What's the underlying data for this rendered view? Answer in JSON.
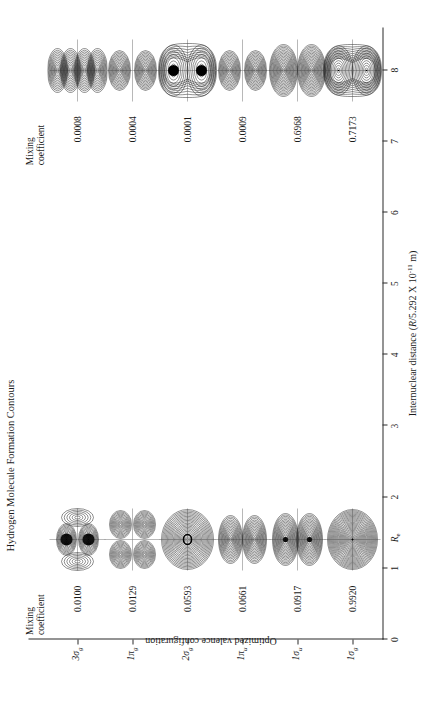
{
  "figure": {
    "title": "Hydrogen Molecule Formation Contours",
    "width": 433,
    "height": 701,
    "rotation_deg": -90,
    "background": "#ffffff",
    "ink": "#1a1a1a"
  },
  "axes": {
    "x": {
      "label_plain": "Internuclear distance (R/5.292 X 10-11 m)",
      "label_prefix": "Internuclear distance (",
      "label_var": "R",
      "label_mid": "/5.292 X 10",
      "label_exp": "-11",
      "label_suffix": " m)",
      "ticks": [
        "0",
        "1",
        "2",
        "3",
        "4",
        "5",
        "6",
        "7",
        "8"
      ],
      "values": [
        0,
        1,
        2,
        3,
        4,
        5,
        6,
        7,
        8
      ],
      "min": 0,
      "max": 8.6,
      "re_marker_label": "Re",
      "re_marker_value": 1.4
    },
    "y": {
      "label": "Optimized valence configuration",
      "ticks": [
        "1σg",
        "1σu",
        "1πu",
        "2σg",
        "1πg",
        "3σg"
      ],
      "tick_bases": [
        "1σ",
        "1σ",
        "1π",
        "2σ",
        "1π",
        "3σ"
      ],
      "tick_subs": [
        "g",
        "u",
        "u",
        "g",
        "g",
        "g"
      ]
    }
  },
  "columns": [
    {
      "name": "bonded",
      "header": "Mixing\ncoefficient",
      "header_line1": "Mixing",
      "header_line2": "coefficient",
      "internuclear_distance": 1.4
    },
    {
      "name": "separated",
      "header": "Mixing\ncoefficient",
      "header_line1": "Mixing",
      "header_line2": "coefficient",
      "internuclear_distance": 8.0
    }
  ],
  "chart_data": {
    "type": "table",
    "title": "Hydrogen Molecule Formation Contours",
    "xlabel": "Internuclear distance (R/5.292 X 10-11 m)",
    "ylabel": "Optimized valence configuration",
    "xlim": [
      0,
      8.6
    ],
    "grid": false,
    "legend": "none",
    "columns": [
      "Optimized valence configuration",
      "Mixing coefficient (R = Re)",
      "Mixing coefficient (R = 8)"
    ],
    "rows": [
      {
        "orbital": "3σg",
        "bonded": "0.0100",
        "separated": "0.0008",
        "bonded_value": 0.01,
        "separated_value": 0.0008
      },
      {
        "orbital": "1πg",
        "bonded": "0.0129",
        "separated": "0.0004",
        "bonded_value": 0.0129,
        "separated_value": 0.0004
      },
      {
        "orbital": "2σg",
        "bonded": "0.0593",
        "separated": "0.0001",
        "bonded_value": 0.0593,
        "separated_value": 0.0001
      },
      {
        "orbital": "1πu",
        "bonded": "0.0661",
        "separated": "0.0009",
        "bonded_value": 0.0661,
        "separated_value": 0.0009
      },
      {
        "orbital": "1σu",
        "bonded": "0.0917",
        "separated": "0.6968",
        "bonded_value": 0.0917,
        "separated_value": 0.6968
      },
      {
        "orbital": "1σg",
        "bonded": "0.9920",
        "separated": "0.7173",
        "bonded_value": 0.992,
        "separated_value": 0.7173
      }
    ]
  },
  "coefficients": {
    "bonded": [
      "0.0100",
      "0.0129",
      "0.0593",
      "0.0661",
      "0.0917",
      "0.9920"
    ],
    "separated": [
      "0.0008",
      "0.0004",
      "0.0001",
      "0.0009",
      "0.6968",
      "0.7173"
    ]
  }
}
